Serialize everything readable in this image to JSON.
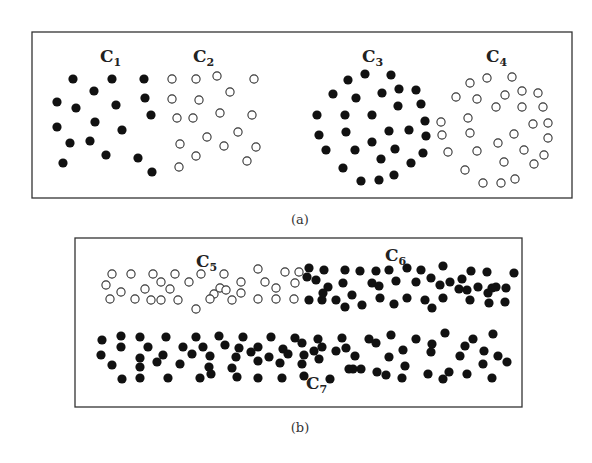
{
  "panels": [
    {
      "caption": "(a)",
      "box": {
        "x": 32,
        "y": 32,
        "w": 540,
        "h": 166
      },
      "clusters": [
        {
          "label": "C",
          "sub": "1",
          "lx": 100,
          "ly": 62,
          "fill": "filled",
          "points": [
            [
              73,
              79
            ],
            [
              112,
              79
            ],
            [
              144,
              79
            ],
            [
              94,
              91
            ],
            [
              57,
              102
            ],
            [
              76,
              108
            ],
            [
              116,
              105
            ],
            [
              145,
              98
            ],
            [
              57,
              127
            ],
            [
              95,
              122
            ],
            [
              122,
              130
            ],
            [
              151,
              115
            ],
            [
              70,
              143
            ],
            [
              90,
              141
            ],
            [
              106,
              155
            ],
            [
              138,
              158
            ],
            [
              63,
              163
            ],
            [
              152,
              172
            ]
          ]
        },
        {
          "label": "C",
          "sub": "2",
          "lx": 193,
          "ly": 62,
          "fill": "hollow",
          "points": [
            [
              172,
              79
            ],
            [
              196,
              79
            ],
            [
              217,
              76
            ],
            [
              254,
              79
            ],
            [
              230,
              92
            ],
            [
              172,
              99
            ],
            [
              199,
              100
            ],
            [
              177,
              118
            ],
            [
              193,
              118
            ],
            [
              220,
              113
            ],
            [
              252,
              115
            ],
            [
              207,
              137
            ],
            [
              238,
              132
            ],
            [
              180,
              144
            ],
            [
              224,
              146
            ],
            [
              256,
              147
            ],
            [
              196,
              156
            ],
            [
              247,
              161
            ],
            [
              179,
              167
            ]
          ]
        },
        {
          "label": "C",
          "sub": "3",
          "lx": 362,
          "ly": 62,
          "fill": "filled",
          "points": [
            [
              348,
              80
            ],
            [
              365,
              74
            ],
            [
              391,
              75
            ],
            [
              333,
              94
            ],
            [
              356,
              98
            ],
            [
              382,
              93
            ],
            [
              399,
              89
            ],
            [
              416,
              90
            ],
            [
              398,
              106
            ],
            [
              421,
              104
            ],
            [
              317,
              115
            ],
            [
              345,
              115
            ],
            [
              372,
              115
            ],
            [
              425,
              121
            ],
            [
              319,
              135
            ],
            [
              346,
              132
            ],
            [
              389,
              131
            ],
            [
              409,
              130
            ],
            [
              426,
              136
            ],
            [
              326,
              150
            ],
            [
              355,
              150
            ],
            [
              372,
              142
            ],
            [
              395,
              149
            ],
            [
              423,
              153
            ],
            [
              381,
              159
            ],
            [
              411,
              163
            ],
            [
              343,
              168
            ],
            [
              361,
              181
            ],
            [
              379,
              180
            ],
            [
              394,
              175
            ]
          ]
        },
        {
          "label": "C",
          "sub": "4",
          "lx": 486,
          "ly": 62,
          "fill": "hollow",
          "points": [
            [
              470,
              83
            ],
            [
              487,
              78
            ],
            [
              512,
              77
            ],
            [
              456,
              97
            ],
            [
              477,
              99
            ],
            [
              505,
              95
            ],
            [
              522,
              91
            ],
            [
              538,
              93
            ],
            [
              496,
              107
            ],
            [
              522,
              107
            ],
            [
              543,
              107
            ],
            [
              441,
              122
            ],
            [
              468,
              118
            ],
            [
              533,
              124
            ],
            [
              548,
              123
            ],
            [
              442,
              135
            ],
            [
              470,
              133
            ],
            [
              514,
              134
            ],
            [
              498,
              143
            ],
            [
              548,
              138
            ],
            [
              448,
              152
            ],
            [
              477,
              151
            ],
            [
              524,
              150
            ],
            [
              504,
              162
            ],
            [
              544,
              155
            ],
            [
              465,
              170
            ],
            [
              534,
              164
            ],
            [
              483,
              183
            ],
            [
              501,
              183
            ],
            [
              515,
              179
            ]
          ]
        }
      ]
    },
    {
      "caption": "(b)",
      "box": {
        "x": 75,
        "y": 238,
        "w": 447,
        "h": 169
      },
      "clusters": [
        {
          "label": "C",
          "sub": "5",
          "lx": 196,
          "ly": 267,
          "fill": "hollow",
          "points": [
            [
              112,
              274
            ],
            [
              131,
              274
            ],
            [
              153,
              274
            ],
            [
              175,
              274
            ],
            [
              201,
              274
            ],
            [
              224,
              274
            ],
            [
              258,
              269
            ],
            [
              285,
              272
            ],
            [
              299,
              272
            ],
            [
              106,
              285
            ],
            [
              121,
              292
            ],
            [
              145,
              289
            ],
            [
              161,
              282
            ],
            [
              170,
              289
            ],
            [
              189,
              282
            ],
            [
              220,
              288
            ],
            [
              241,
              282
            ],
            [
              265,
              282
            ],
            [
              276,
              288
            ],
            [
              295,
              283
            ],
            [
              110,
              299
            ],
            [
              135,
              299
            ],
            [
              151,
              300
            ],
            [
              161,
              300
            ],
            [
              178,
              300
            ],
            [
              214,
              294
            ],
            [
              210,
              299
            ],
            [
              232,
              300
            ],
            [
              241,
              293
            ],
            [
              258,
              299
            ],
            [
              276,
              299
            ],
            [
              294,
              299
            ],
            [
              196,
              309
            ],
            [
              226,
              290
            ]
          ]
        },
        {
          "label": "C",
          "sub": "6",
          "lx": 396,
          "ly": 259,
          "fill": "filled",
          "points": [
            [
              309,
              268
            ],
            [
              324,
              270
            ],
            [
              345,
              270
            ],
            [
              360,
              271
            ],
            [
              376,
              271
            ],
            [
              389,
              270
            ],
            [
              407,
              268
            ],
            [
              421,
              270
            ],
            [
              443,
              266
            ],
            [
              471,
              271
            ],
            [
              487,
              272
            ],
            [
              514,
              273
            ],
            [
              307,
              277
            ],
            [
              316,
              280
            ],
            [
              328,
              287
            ],
            [
              343,
              283
            ],
            [
              372,
              283
            ],
            [
              379,
              286
            ],
            [
              396,
              281
            ],
            [
              416,
              282
            ],
            [
              431,
              278
            ],
            [
              440,
              285
            ],
            [
              450,
              282
            ],
            [
              462,
              279
            ],
            [
              467,
              290
            ],
            [
              478,
              287
            ],
            [
              492,
              288
            ],
            [
              496,
              287
            ],
            [
              506,
              288
            ],
            [
              309,
              300
            ],
            [
              322,
              300
            ],
            [
              336,
              300
            ],
            [
              345,
              307
            ],
            [
              362,
              305
            ],
            [
              380,
              298
            ],
            [
              394,
              304
            ],
            [
              407,
              298
            ],
            [
              425,
              300
            ],
            [
              432,
              308
            ],
            [
              443,
              298
            ],
            [
              459,
              289
            ],
            [
              470,
              300
            ],
            [
              488,
              293
            ],
            [
              489,
              303
            ],
            [
              505,
              302
            ],
            [
              323,
              293
            ],
            [
              352,
              295
            ]
          ]
        },
        {
          "label": "C",
          "sub": "7",
          "lx": 312,
          "ly": 387,
          "fill": "filled",
          "points": [
            [
              102,
              340
            ],
            [
              121,
              336
            ],
            [
              140,
              337
            ],
            [
              166,
              337
            ],
            [
              196,
              337
            ],
            [
              219,
              336
            ],
            [
              243,
              337
            ],
            [
              271,
              337
            ],
            [
              295,
              338
            ],
            [
              318,
              339
            ],
            [
              342,
              338
            ],
            [
              369,
              339
            ],
            [
              391,
              335
            ],
            [
              416,
              339
            ],
            [
              445,
              333
            ],
            [
              473,
              339
            ],
            [
              493,
              334
            ],
            [
              121,
              347
            ],
            [
              148,
              347
            ],
            [
              183,
              347
            ],
            [
              203,
              347
            ],
            [
              225,
              345
            ],
            [
              239,
              348
            ],
            [
              258,
              347
            ],
            [
              283,
              349
            ],
            [
              302,
              343
            ],
            [
              322,
              347
            ],
            [
              346,
              348
            ],
            [
              376,
              343
            ],
            [
              403,
              350
            ],
            [
              432,
              344
            ],
            [
              465,
              346
            ],
            [
              484,
              351
            ],
            [
              101,
              355
            ],
            [
              140,
              358
            ],
            [
              163,
              355
            ],
            [
              192,
              354
            ],
            [
              210,
              356
            ],
            [
              236,
              357
            ],
            [
              251,
              352
            ],
            [
              269,
              357
            ],
            [
              288,
              354
            ],
            [
              304,
              355
            ],
            [
              314,
              351
            ],
            [
              336,
              351
            ],
            [
              355,
              356
            ],
            [
              389,
              357
            ],
            [
              431,
              352
            ],
            [
              460,
              356
            ],
            [
              498,
              356
            ],
            [
              112,
              365
            ],
            [
              140,
              367
            ],
            [
              157,
              362
            ],
            [
              180,
              364
            ],
            [
              209,
              367
            ],
            [
              232,
              368
            ],
            [
              258,
              361
            ],
            [
              280,
              363
            ],
            [
              302,
              364
            ],
            [
              319,
              359
            ],
            [
              349,
              369
            ],
            [
              353,
              369
            ],
            [
              361,
              369
            ],
            [
              377,
              372
            ],
            [
              405,
              366
            ],
            [
              428,
              374
            ],
            [
              449,
              372
            ],
            [
              483,
              364
            ],
            [
              507,
              362
            ],
            [
              122,
              379
            ],
            [
              140,
              378
            ],
            [
              168,
              378
            ],
            [
              200,
              378
            ],
            [
              211,
              374
            ],
            [
              237,
              377
            ],
            [
              258,
              378
            ],
            [
              282,
              378
            ],
            [
              304,
              376
            ],
            [
              330,
              379
            ],
            [
              386,
              375
            ],
            [
              402,
              378
            ],
            [
              443,
              379
            ],
            [
              467,
              374
            ],
            [
              492,
              378
            ]
          ]
        }
      ]
    }
  ]
}
